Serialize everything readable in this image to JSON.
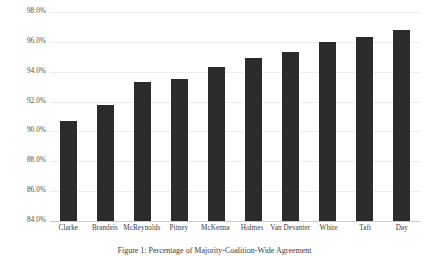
{
  "chart_data": {
    "type": "bar",
    "title": "",
    "xlabel": "",
    "ylabel": "",
    "ylim": [
      84.0,
      98.0
    ],
    "ytick_step": 2.0,
    "ytick_labels": [
      "98.0%",
      "96.0%",
      "94.0%",
      "92.0%",
      "90.0%",
      "88.0%",
      "86.0%",
      "84.0%"
    ],
    "ytick_values": [
      98.0,
      96.0,
      94.0,
      92.0,
      90.0,
      88.0,
      86.0,
      84.0
    ],
    "grid": true,
    "legend": "none",
    "bar_color": "#2b2b2b",
    "grid_color": "#ededed",
    "axis_color": "#c9c9c9",
    "categories": [
      "Clarke",
      "Brandeis",
      "McReynolds",
      "Pitney",
      "McKenna",
      "Holmes",
      "Van Devanter",
      "White",
      "Taft",
      "Day"
    ],
    "values": [
      90.7,
      91.8,
      93.3,
      93.5,
      94.3,
      94.9,
      95.3,
      96.0,
      96.3,
      96.8
    ]
  },
  "caption": {
    "text": "Figure 1:  Percentage of Majority-Coalition-Wide Agreement"
  }
}
